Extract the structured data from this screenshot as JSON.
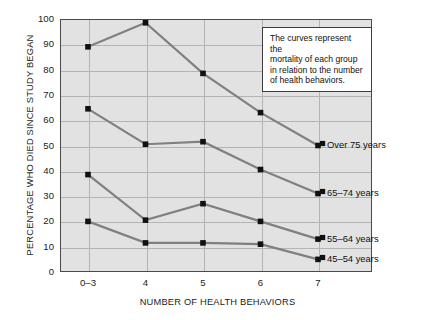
{
  "chart_data": {
    "type": "line",
    "title": "",
    "xlabel": "NUMBER OF HEALTH BEHAVIORS",
    "ylabel": "PERCENTAGE WHO DIED SINCE STUDY BEGAN",
    "categories": [
      "0–3",
      "4",
      "5",
      "6",
      "7"
    ],
    "xtick_labels": [
      "0–3",
      "4",
      "5",
      "6",
      "7"
    ],
    "ytick_labels": [
      "0",
      "10",
      "20",
      "30",
      "40",
      "50",
      "60",
      "70",
      "80",
      "90",
      "100"
    ],
    "ylim": [
      0,
      100
    ],
    "ytick_step": 10,
    "grid": true,
    "legend_position": "right-inline",
    "marker": "square",
    "series": [
      {
        "name": "Over 75 years",
        "label": "Over 75 years",
        "values": [
          89,
          98.5,
          78.5,
          63,
          50
        ]
      },
      {
        "name": "65–74 years",
        "label": "65–74 years",
        "values": [
          64.5,
          50.5,
          51.5,
          40.5,
          31
        ]
      },
      {
        "name": "55–64 years",
        "label": "55–64 years",
        "values": [
          38.5,
          20.5,
          27,
          20,
          13
        ]
      },
      {
        "name": "45–54 years",
        "label": "45–54 years",
        "values": [
          20,
          11.5,
          11.5,
          11,
          5
        ]
      }
    ],
    "annotation": {
      "line1": "The curves represent the",
      "line2": "mortality of each group",
      "line3": "in relation to the number",
      "line4": "of health behaviors."
    },
    "colors": {
      "plot_background": "#e2e2e2",
      "page_background": "#ffffff",
      "line": "#808080",
      "marker": "#111111",
      "grid": "#b4b4b4",
      "axis_border": "#4a4a4a",
      "text": "#1b1b1b"
    }
  }
}
